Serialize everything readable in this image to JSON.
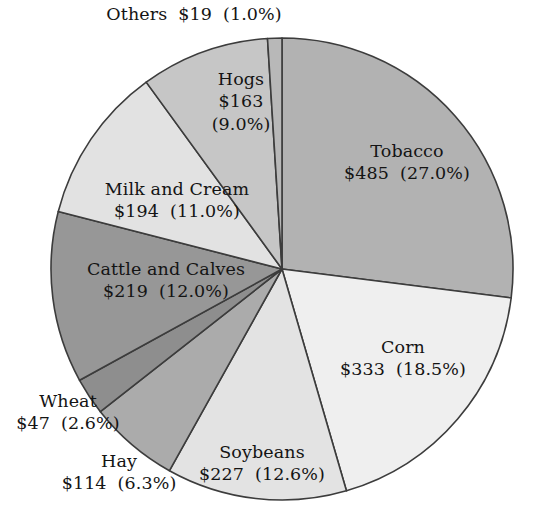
{
  "chart_data": {
    "type": "pie",
    "title": "",
    "subtitle": "",
    "units": "millions of dollars",
    "value_prefix": "$",
    "total_value": 1801,
    "legend_position": "none",
    "labels_position": "on-slice",
    "start_angle_deg": -90,
    "direction": "clockwise",
    "categories": [
      "Tobacco",
      "Corn",
      "Soybeans",
      "Hay",
      "Wheat",
      "Cattle and Calves",
      "Milk and Cream",
      "Hogs",
      "Others"
    ],
    "values": [
      485,
      333,
      227,
      114,
      47,
      219,
      194,
      163,
      19
    ],
    "percents": [
      27.0,
      18.5,
      12.6,
      6.3,
      2.6,
      12.0,
      11.0,
      9.0,
      1.0
    ],
    "slices": [
      {
        "id": "tobacco",
        "name": "Tobacco",
        "value": 485,
        "value_text": "$485",
        "percent": 27.0,
        "percent_text": "(27.0%)",
        "color": "#b2b2b2"
      },
      {
        "id": "corn",
        "name": "Corn",
        "value": 333,
        "value_text": "$333",
        "percent": 18.5,
        "percent_text": "(18.5%)",
        "color": "#efefef"
      },
      {
        "id": "soybeans",
        "name": "Soybeans",
        "value": 227,
        "value_text": "$227",
        "percent": 12.6,
        "percent_text": "(12.6%)",
        "color": "#e3e3e3"
      },
      {
        "id": "hay",
        "name": "Hay",
        "value": 114,
        "value_text": "$114",
        "percent": 6.3,
        "percent_text": "(6.3%)",
        "color": "#ababab"
      },
      {
        "id": "wheat",
        "name": "Wheat",
        "value": 47,
        "value_text": "$47",
        "percent": 2.6,
        "percent_text": "(2.6%)",
        "color": "#8e8e8e"
      },
      {
        "id": "cattle-and-calves",
        "name": "Cattle and Calves",
        "value": 219,
        "value_text": "$219",
        "percent": 12.0,
        "percent_text": "(12.0%)",
        "color": "#979797"
      },
      {
        "id": "milk-and-cream",
        "name": "Milk and Cream",
        "value": 194,
        "value_text": "$194",
        "percent": 11.0,
        "percent_text": "(11.0%)",
        "color": "#e2e2e2"
      },
      {
        "id": "hogs",
        "name": "Hogs",
        "value": 163,
        "value_text": "$163",
        "percent": 9.0,
        "percent_text": "(9.0%)",
        "color": "#c6c6c6"
      },
      {
        "id": "others",
        "name": "Others",
        "value": 19,
        "value_text": "$19",
        "percent": 1.0,
        "percent_text": "(1.0%)",
        "color": "#b8b8b8"
      }
    ],
    "geometry": {
      "center_x": 282,
      "center_y": 269,
      "radius": 231
    },
    "style": {
      "slice_border_color": "#3c3c3c",
      "background": "#ffffff",
      "text_color": "#141414"
    }
  },
  "labels": {
    "others": {
      "name": "Others",
      "value": "$19",
      "percent": "(1.0%)"
    },
    "hogs": {
      "name": "Hogs",
      "value": "$163",
      "percent": "(9.0%)"
    },
    "tobacco": {
      "name": "Tobacco",
      "value": "$485",
      "percent": "(27.0%)"
    },
    "milk": {
      "name": "Milk and Cream",
      "value": "$194",
      "percent": "(11.0%)"
    },
    "cattle": {
      "name": "Cattle and Calves",
      "value": "$219",
      "percent": "(12.0%)"
    },
    "corn": {
      "name": "Corn",
      "value": "$333",
      "percent": "(18.5%)"
    },
    "soybeans": {
      "name": "Soybeans",
      "value": "$227",
      "percent": "(12.6%)"
    },
    "wheat": {
      "name": "Wheat",
      "value": "$47",
      "percent": "(2.6%)"
    },
    "hay": {
      "name": "Hay",
      "value": "$114",
      "percent": "(6.3%)"
    }
  }
}
